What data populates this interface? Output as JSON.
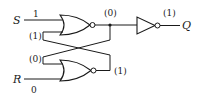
{
  "diagram": {
    "type": "logic-circuit",
    "inputs": {
      "s": {
        "name": "S",
        "value": "1"
      },
      "r": {
        "name": "R",
        "value": "0"
      }
    },
    "feedback_labels": {
      "top_gate_lower_input": "(1)",
      "bottom_gate_upper_input": "(0)"
    },
    "node_labels": {
      "top_gate_output": "(0)",
      "bottom_gate_output": "(1)",
      "inverter_output": "(1)"
    },
    "output": {
      "name": "Q"
    },
    "components": [
      {
        "id": "nor-top",
        "kind": "NOR"
      },
      {
        "id": "nor-bottom",
        "kind": "NOR"
      },
      {
        "id": "not",
        "kind": "NOT"
      }
    ]
  }
}
